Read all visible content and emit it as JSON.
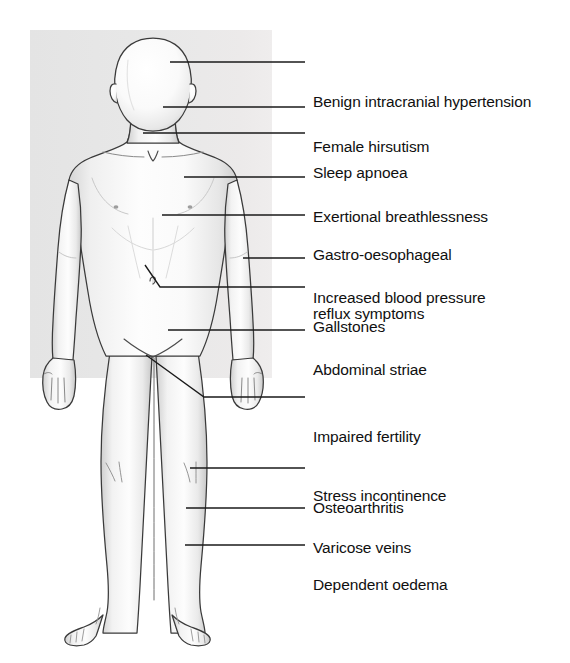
{
  "figure": {
    "name": "obesity-complications-body-diagram",
    "panel_color": "#e6e6e6",
    "body_outline_color": "#333333",
    "body_fill_color": "#fbfbfb",
    "leader_line_color": "#1a1a1a",
    "text_color": "#101010",
    "background_color": "#ffffff"
  },
  "labels": [
    {
      "id": "benign-intracranial-hypertension",
      "lines": [
        "Benign intracranial hypertension"
      ],
      "text_x": 313,
      "text_y": 53,
      "leader": {
        "x1": 170,
        "y1": 62,
        "x2": 305,
        "y2": 62
      },
      "anchor": "forehead"
    },
    {
      "id": "female-hirsutism",
      "lines": [
        "Female hirsutism"
      ],
      "text_x": 313,
      "text_y": 98,
      "leader": {
        "x1": 163,
        "y1": 107,
        "x2": 305,
        "y2": 107
      },
      "anchor": "chin-jaw"
    },
    {
      "id": "sleep-apnoea",
      "lines": [
        "Sleep apnoea"
      ],
      "text_x": 313,
      "text_y": 124,
      "leader": {
        "x1": 143,
        "y1": 133,
        "x2": 305,
        "y2": 133
      },
      "anchor": "throat-neck"
    },
    {
      "id": "exertional-breathlessness",
      "lines": [
        "Exertional breathlessness"
      ],
      "text_x": 313,
      "text_y": 168,
      "leader": {
        "x1": 184,
        "y1": 177,
        "x2": 305,
        "y2": 177
      },
      "anchor": "upper-chest"
    },
    {
      "id": "gastro-oesophageal-reflux-symptoms",
      "lines": [
        "Gastro-oesophageal",
        "reflux symptoms"
      ],
      "text_x": 313,
      "text_y": 206,
      "leader": {
        "x1": 162,
        "y1": 215,
        "x2": 305,
        "y2": 215
      },
      "anchor": "lower-chest-epigastrium"
    },
    {
      "id": "increased-blood-pressure",
      "lines": [
        "Increased blood pressure"
      ],
      "text_x": 313,
      "text_y": 249,
      "leader": {
        "x1": 243,
        "y1": 258,
        "x2": 305,
        "y2": 258
      },
      "anchor": "right-arm"
    },
    {
      "id": "gallstones",
      "lines": [
        "Gallstones"
      ],
      "text_x": 313,
      "text_y": 278,
      "leader_polyline": "145,265 160,287 305,287",
      "anchor": "right-upper-quadrant"
    },
    {
      "id": "abdominal-striae",
      "lines": [
        "Abdominal striae"
      ],
      "text_x": 313,
      "text_y": 321,
      "leader": {
        "x1": 168,
        "y1": 330,
        "x2": 305,
        "y2": 330
      },
      "anchor": "lower-abdomen"
    },
    {
      "id": "impaired-fertility-stress-incontinence",
      "lines": [
        "Impaired fertility",
        "Stress incontinence"
      ],
      "text_x": 313,
      "text_y": 388,
      "leader_polyline": "146,355 204,397 305,397",
      "anchor": "groin-pelvis"
    },
    {
      "id": "osteoarthritis",
      "lines": [
        "Osteoarthritis"
      ],
      "text_x": 313,
      "text_y": 459,
      "leader": {
        "x1": 190,
        "y1": 468,
        "x2": 305,
        "y2": 468
      },
      "anchor": "knee"
    },
    {
      "id": "varicose-veins",
      "lines": [
        "Varicose veins"
      ],
      "text_x": 313,
      "text_y": 499,
      "leader": {
        "x1": 186,
        "y1": 508,
        "x2": 305,
        "y2": 508
      },
      "anchor": "calf"
    },
    {
      "id": "dependent-oedema",
      "lines": [
        "Dependent oedema"
      ],
      "text_x": 313,
      "text_y": 536,
      "leader": {
        "x1": 185,
        "y1": 545,
        "x2": 305,
        "y2": 545
      },
      "anchor": "lower-shin-ankle"
    }
  ]
}
